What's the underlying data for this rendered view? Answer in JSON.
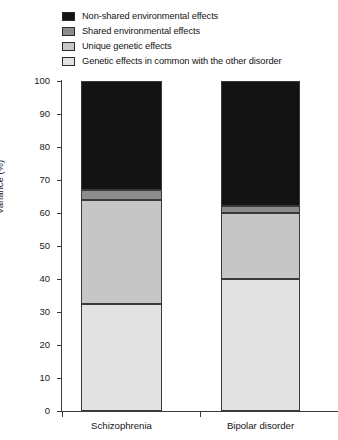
{
  "chart_data": {
    "type": "bar",
    "subtype": "stacked-bar",
    "title": "",
    "xlabel": "",
    "ylabel": "Variance (%)",
    "ylim": [
      0,
      100
    ],
    "yticks": [
      0,
      10,
      20,
      30,
      40,
      50,
      60,
      70,
      80,
      90,
      100
    ],
    "grid": false,
    "legend_position": "top-left",
    "categories": [
      "Schizophrenia",
      "Bipolar disorder"
    ],
    "stack_order_bottom_to_top": [
      "Genetic effects in common with the other disorder",
      "Unique genetic effects",
      "Shared environmental effects",
      "Non-shared environmental effects"
    ],
    "series": [
      {
        "name": "Non-shared environmental effects",
        "color": "#131313",
        "values": [
          33,
          38
        ]
      },
      {
        "name": "Shared environmental effects",
        "color": "#8c8c8c",
        "values": [
          3,
          2
        ]
      },
      {
        "name": "Unique genetic effects",
        "color": "#c6c6c6",
        "values": [
          31.5,
          20
        ]
      },
      {
        "name": "Genetic effects in common with the other disorder",
        "color": "#e2e2e2",
        "values": [
          32.5,
          40
        ]
      }
    ],
    "cumulative_tops": {
      "Schizophrenia": [
        32.5,
        64,
        67,
        100
      ],
      "Bipolar disorder": [
        40,
        60,
        62,
        100
      ]
    }
  },
  "legend": {
    "items": [
      {
        "label": "Non-shared environmental effects",
        "color": "#131313"
      },
      {
        "label": "Shared environmental effects",
        "color": "#8c8c8c"
      },
      {
        "label": "Unique genetic effects",
        "color": "#c6c6c6"
      },
      {
        "label": "Genetic effects in common with the other disorder",
        "color": "#e2e2e2"
      }
    ]
  },
  "axes": {
    "y_title": "Variance (%)",
    "y_tick_labels": [
      "100",
      "90",
      "80",
      "70",
      "60",
      "50",
      "40",
      "30",
      "20",
      "10",
      "0"
    ],
    "x_tick_labels": [
      "Schizophrenia",
      "Bipolar disorder"
    ]
  },
  "colors": {
    "axis": "#3a3a3a",
    "text": "#141414",
    "background": "#ffffff"
  }
}
